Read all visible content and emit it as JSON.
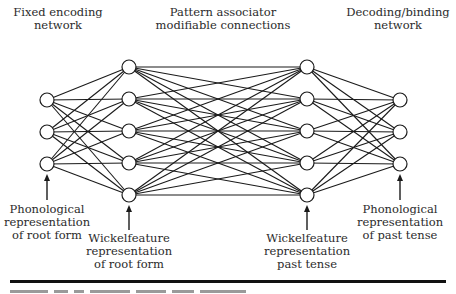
{
  "column_headers": [
    {
      "id": "fixed-encoding",
      "lines": [
        "Fixed encoding",
        "network"
      ],
      "x": 58,
      "y": 6
    },
    {
      "id": "pattern-associator",
      "lines": [
        "Pattern associator",
        "modifiable connections"
      ],
      "x": 223,
      "y": 6
    },
    {
      "id": "decoding-binding",
      "lines": [
        "Decoding/binding",
        "network"
      ],
      "x": 398,
      "y": 6
    }
  ],
  "layers": [
    {
      "id": "phonological-root",
      "x": 47,
      "ys": [
        100,
        132,
        164
      ]
    },
    {
      "id": "wickelfeature-root",
      "x": 129,
      "ys": [
        67,
        99,
        131,
        163,
        195
      ]
    },
    {
      "id": "wickelfeature-past",
      "x": 307,
      "ys": [
        67,
        99,
        131,
        163,
        195
      ]
    },
    {
      "id": "phonological-past",
      "x": 400,
      "ys": [
        100,
        132,
        164
      ]
    }
  ],
  "node_radius": 7,
  "arrows": [
    {
      "target": "phonological-root",
      "x": 47,
      "y_from": 200,
      "y_to": 174
    },
    {
      "target": "wickelfeature-root",
      "x": 129,
      "y_from": 230,
      "y_to": 205
    },
    {
      "target": "wickelfeature-past",
      "x": 307,
      "y_from": 230,
      "y_to": 205
    },
    {
      "target": "phonological-past",
      "x": 400,
      "y_from": 200,
      "y_to": 174
    }
  ],
  "bottom_labels": [
    {
      "id": "phonological-root-label",
      "lines": [
        "Phonological",
        "representation",
        "of root form"
      ],
      "x": 47,
      "y": 203
    },
    {
      "id": "wickelfeature-root-label",
      "lines": [
        "Wickelfeature",
        "representation",
        "of root form"
      ],
      "x": 129,
      "y": 232
    },
    {
      "id": "wickelfeature-past-label",
      "lines": [
        "Wickelfeature",
        "representation",
        "past tense"
      ],
      "x": 307,
      "y": 232
    },
    {
      "id": "phonological-past-label",
      "lines": [
        "Phonological",
        "representation",
        "of past tense"
      ],
      "x": 400,
      "y": 203
    }
  ],
  "colors": {
    "line": "#1a1a1a",
    "node_fill": "#ffffff",
    "text": "#2b2b2b",
    "rule": "#111111"
  }
}
